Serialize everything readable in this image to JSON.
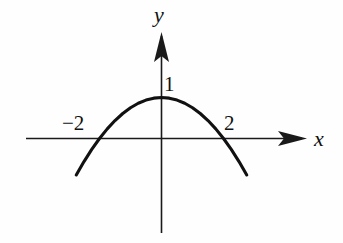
{
  "figure": {
    "background_color": "#fefefe",
    "ink_color": "#111111"
  },
  "axes": {
    "x_axis_label": "x",
    "y_axis_label": "y",
    "x_axis_name": "horizontal-axis",
    "y_axis_name": "vertical-axis",
    "x_arrow_icon": "arrow-right-icon",
    "y_arrow_icon": "arrow-up-icon"
  },
  "labels": {
    "y_intercept": "1",
    "x_intercept_left": "−2",
    "x_intercept_right": "2"
  },
  "chart_data": {
    "type": "line",
    "title": "",
    "subtitle": "",
    "xlabel": "x",
    "ylabel": "y",
    "grid": false,
    "legend": "none",
    "curve_label": "downward-opening parabola",
    "equation": "y = 1 - x^2/4",
    "vertex": [
      0,
      1
    ],
    "x_intercepts": [
      -2,
      2
    ],
    "y_intercept": 1,
    "opens": "down",
    "xlim": [
      -2.8,
      2.8
    ],
    "ylim": [
      -2.0,
      1.3
    ],
    "axis_tick_labels": {
      "x": [
        "-2",
        "2"
      ],
      "y": [
        "1"
      ]
    },
    "x": [
      -2.75,
      -2.5,
      -2.25,
      -2.0,
      -1.75,
      -1.5,
      -1.25,
      -1.0,
      -0.75,
      -0.5,
      -0.25,
      0.0,
      0.25,
      0.5,
      0.75,
      1.0,
      1.25,
      1.5,
      1.75,
      2.0,
      2.25,
      2.5,
      2.75
    ],
    "y": [
      -0.89,
      -0.5625,
      -0.2656,
      0.0,
      0.2344,
      0.4375,
      0.6094,
      0.75,
      0.8594,
      0.9375,
      0.9844,
      1.0,
      0.9844,
      0.9375,
      0.8594,
      0.75,
      0.6094,
      0.4375,
      0.2344,
      0.0,
      -0.2656,
      -0.5625,
      -0.89
    ],
    "series": [
      {
        "name": "y = 1 - x^2/4",
        "values": [
          -0.89,
          -0.5625,
          -0.2656,
          0.0,
          0.2344,
          0.4375,
          0.6094,
          0.75,
          0.8594,
          0.9375,
          0.9844,
          1.0,
          0.9844,
          0.9375,
          0.8594,
          0.75,
          0.6094,
          0.4375,
          0.2344,
          0.0,
          -0.2656,
          -0.5625,
          -0.89
        ]
      }
    ]
  }
}
